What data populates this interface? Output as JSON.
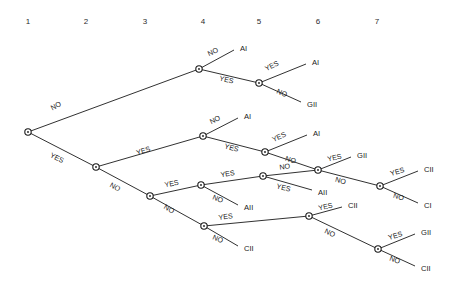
{
  "diagram": {
    "type": "decision-tree",
    "column_headers": [
      {
        "label": "1",
        "x": 28,
        "y": 21
      },
      {
        "label": "2",
        "x": 86,
        "y": 21
      },
      {
        "label": "3",
        "x": 145,
        "y": 21
      },
      {
        "label": "4",
        "x": 203,
        "y": 21
      },
      {
        "label": "5",
        "x": 259,
        "y": 21
      },
      {
        "label": "6",
        "x": 318,
        "y": 21
      },
      {
        "label": "7",
        "x": 377,
        "y": 21
      }
    ],
    "nodes": [
      {
        "id": "n1",
        "column": 1,
        "x": 28,
        "y": 132
      },
      {
        "id": "n2",
        "column": 2,
        "x": 96,
        "y": 167
      },
      {
        "id": "n3",
        "column": 4,
        "x": 199,
        "y": 69
      },
      {
        "id": "n4",
        "column": 5,
        "x": 259,
        "y": 83
      },
      {
        "id": "n5",
        "column": 4,
        "x": 203,
        "y": 136
      },
      {
        "id": "n6",
        "column": 5,
        "x": 265,
        "y": 152
      },
      {
        "id": "n7",
        "column": 6,
        "x": 318,
        "y": 170
      },
      {
        "id": "n8",
        "column": 7,
        "x": 380,
        "y": 186
      },
      {
        "id": "n9",
        "column": 3,
        "x": 150,
        "y": 196
      },
      {
        "id": "n10",
        "column": 4,
        "x": 201,
        "y": 185
      },
      {
        "id": "n11",
        "column": 5,
        "x": 263,
        "y": 176
      },
      {
        "id": "n12",
        "column": 4,
        "x": 204,
        "y": 226
      },
      {
        "id": "n13",
        "column": 6,
        "x": 309,
        "y": 216
      },
      {
        "id": "n14",
        "column": 7,
        "x": 378,
        "y": 249
      }
    ],
    "edges": [
      {
        "id": "e1",
        "from": "n1",
        "to": "n3",
        "label": "NO",
        "label_x": 57,
        "label_y": 108,
        "label_rot": -27
      },
      {
        "id": "e2",
        "from": "n1",
        "to": "n2",
        "label": "YES",
        "label_x": 56,
        "label_y": 160,
        "label_rot": 27
      },
      {
        "id": "e3",
        "from": "n3",
        "to": "leaf1",
        "label": "NO",
        "label_x": 214,
        "label_y": 54,
        "label_rot": -25
      },
      {
        "id": "e4",
        "from": "n3",
        "to": "n4",
        "label": "YES",
        "label_x": 226,
        "label_y": 82,
        "label_rot": 13
      },
      {
        "id": "e5",
        "from": "n4",
        "to": "leaf2",
        "label": "YES",
        "label_x": 273,
        "label_y": 68,
        "label_rot": -27
      },
      {
        "id": "e6",
        "from": "n4",
        "to": "leaf3",
        "label": "NO",
        "label_x": 281,
        "label_y": 95,
        "label_rot": 23
      },
      {
        "id": "e7",
        "from": "n2",
        "to": "n5",
        "label": "YES",
        "label_x": 144,
        "label_y": 153,
        "label_rot": -18
      },
      {
        "id": "e8",
        "from": "n2",
        "to": "n9",
        "label": "NO",
        "label_x": 114,
        "label_y": 189,
        "label_rot": 28
      },
      {
        "id": "e9",
        "from": "n5",
        "to": "leaf4",
        "label": "NO",
        "label_x": 216,
        "label_y": 122,
        "label_rot": -26
      },
      {
        "id": "e10",
        "from": "n5",
        "to": "n6",
        "label": "YES",
        "label_x": 231,
        "label_y": 150,
        "label_rot": 15
      },
      {
        "id": "e11",
        "from": "n6",
        "to": "leaf5",
        "label": "YES",
        "label_x": 280,
        "label_y": 139,
        "label_rot": -24
      },
      {
        "id": "e12",
        "from": "n6",
        "to": "n7",
        "label": "NO",
        "label_x": 290,
        "label_y": 162,
        "label_rot": 17
      },
      {
        "id": "e13",
        "from": "n7",
        "to": "leaf6",
        "label": "YES",
        "label_x": 335,
        "label_y": 160,
        "label_rot": -13
      },
      {
        "id": "e14",
        "from": "n7",
        "to": "n8",
        "label": "NO",
        "label_x": 340,
        "label_y": 183,
        "label_rot": 15
      },
      {
        "id": "e15",
        "from": "n8",
        "to": "leaf7",
        "label": "YES",
        "label_x": 398,
        "label_y": 174,
        "label_rot": -17
      },
      {
        "id": "e16",
        "from": "n8",
        "to": "leaf8",
        "label": "NO",
        "label_x": 398,
        "label_y": 199,
        "label_rot": 17
      },
      {
        "id": "e17",
        "from": "n9",
        "to": "n10",
        "label": "YES",
        "label_x": 172,
        "label_y": 186,
        "label_rot": -11
      },
      {
        "id": "e18",
        "from": "n9",
        "to": "n12",
        "label": "NO",
        "label_x": 168,
        "label_y": 211,
        "label_rot": 30
      },
      {
        "id": "e19",
        "from": "n10",
        "to": "n11",
        "label": "YES",
        "label_x": 228,
        "label_y": 176,
        "label_rot": -9
      },
      {
        "id": "e20",
        "from": "n10",
        "to": "leaf9",
        "label": "NO",
        "label_x": 217,
        "label_y": 201,
        "label_rot": 22
      },
      {
        "id": "e21",
        "from": "n11",
        "to": "n7",
        "label": "NO",
        "label_x": 285,
        "label_y": 169,
        "label_rot": -7
      },
      {
        "id": "e22",
        "from": "n11",
        "to": "leaf10",
        "label": "YES",
        "label_x": 283,
        "label_y": 190,
        "label_rot": 14
      },
      {
        "id": "e23",
        "from": "n12",
        "to": "n13",
        "label": "YES",
        "label_x": 226,
        "label_y": 219,
        "label_rot": -7
      },
      {
        "id": "e24",
        "from": "n12",
        "to": "leaf11",
        "label": "NO",
        "label_x": 217,
        "label_y": 241,
        "label_rot": 23
      },
      {
        "id": "e25",
        "from": "n13",
        "to": "leaf12",
        "label": "YES",
        "label_x": 326,
        "label_y": 209,
        "label_rot": -13
      },
      {
        "id": "e26",
        "from": "n13",
        "to": "n14",
        "label": "NO",
        "label_x": 329,
        "label_y": 235,
        "label_rot": 25
      },
      {
        "id": "e27",
        "from": "n14",
        "to": "leaf13",
        "label": "YES",
        "label_x": 396,
        "label_y": 238,
        "label_rot": -17
      },
      {
        "id": "e28",
        "from": "n14",
        "to": "leaf14",
        "label": "NO",
        "label_x": 394,
        "label_y": 262,
        "label_rot": 20
      }
    ],
    "leaves": [
      {
        "id": "leaf1",
        "label": "AI",
        "x": 240,
        "y": 48,
        "anchor_x": 234,
        "anchor_y": 50
      },
      {
        "id": "leaf2",
        "label": "AI",
        "x": 312,
        "y": 62,
        "anchor_x": 306,
        "anchor_y": 64
      },
      {
        "id": "leaf3",
        "label": "GII",
        "x": 307,
        "y": 104,
        "anchor_x": 301,
        "anchor_y": 102
      },
      {
        "id": "leaf4",
        "label": "AI",
        "x": 244,
        "y": 116,
        "anchor_x": 238,
        "anchor_y": 118
      },
      {
        "id": "leaf5",
        "label": "AI",
        "x": 313,
        "y": 133,
        "anchor_x": 307,
        "anchor_y": 135
      },
      {
        "id": "leaf6",
        "label": "GII",
        "x": 357,
        "y": 155,
        "anchor_x": 351,
        "anchor_y": 157
      },
      {
        "id": "leaf7",
        "label": "CII",
        "x": 424,
        "y": 169,
        "anchor_x": 418,
        "anchor_y": 171
      },
      {
        "id": "leaf8",
        "label": "CI",
        "x": 424,
        "y": 205,
        "anchor_x": 418,
        "anchor_y": 203
      },
      {
        "id": "leaf9",
        "label": "AII",
        "x": 244,
        "y": 207,
        "anchor_x": 238,
        "anchor_y": 205
      },
      {
        "id": "leaf10",
        "label": "AII",
        "x": 318,
        "y": 192,
        "anchor_x": 312,
        "anchor_y": 190
      },
      {
        "id": "leaf11",
        "label": "CII",
        "x": 244,
        "y": 248,
        "anchor_x": 238,
        "anchor_y": 246
      },
      {
        "id": "leaf12",
        "label": "CII",
        "x": 348,
        "y": 205,
        "anchor_x": 342,
        "anchor_y": 207
      },
      {
        "id": "leaf13",
        "label": "GII",
        "x": 421,
        "y": 232,
        "anchor_x": 415,
        "anchor_y": 234
      },
      {
        "id": "leaf14",
        "label": "CII",
        "x": 421,
        "y": 268,
        "anchor_x": 415,
        "anchor_y": 266
      }
    ],
    "colors": {
      "line": "#1a1a1a",
      "background": "#ffffff",
      "text": "#1a1a1a",
      "header_text": "#2b2b2b"
    }
  }
}
